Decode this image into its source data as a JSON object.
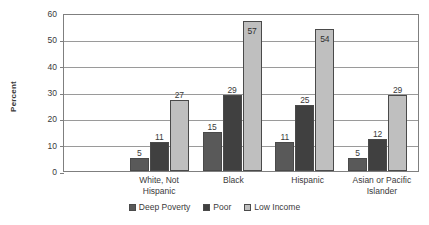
{
  "chart_data": {
    "type": "bar",
    "title": "",
    "xlabel": "",
    "ylabel": "Percent",
    "ylim": [
      0,
      60
    ],
    "yticks": [
      0,
      10,
      20,
      30,
      40,
      50,
      60
    ],
    "grid": true,
    "legend_position": "bottom",
    "categories": [
      "White, Not Hispanic",
      "Black",
      "Hispanic",
      "Asian or Pacific Islander"
    ],
    "category_lines": [
      [
        "White, Not",
        "Hispanic"
      ],
      [
        "Black"
      ],
      [
        "Hispanic"
      ],
      [
        "Asian or Pacific",
        "Islander"
      ]
    ],
    "series": [
      {
        "name": "Deep Poverty",
        "color": "#595959",
        "values": [
          5,
          15,
          11,
          5
        ]
      },
      {
        "name": "Poor",
        "color": "#404040",
        "values": [
          11,
          29,
          25,
          12
        ]
      },
      {
        "name": "Low Income",
        "color": "#bfbfbf",
        "values": [
          27,
          57,
          54,
          29
        ]
      }
    ]
  }
}
